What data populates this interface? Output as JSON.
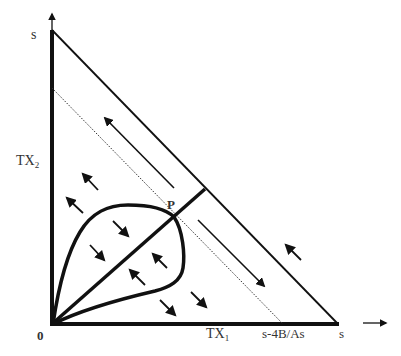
{
  "diagram": {
    "type": "phase-diagram",
    "colors": {
      "ink": "#111111",
      "label": "#333333",
      "background": "#ffffff"
    },
    "axes": {
      "x_label": "TX",
      "x_label_sub": "1",
      "y_label": "TX",
      "y_label_sub": "2",
      "origin_label": "0",
      "x_max_label": "s",
      "y_max_label": "s",
      "x_intercept_label": "s-4B/As"
    },
    "point_label": "P",
    "elements": {
      "boundary_line": "hypotenuse from (0,s) to (s,0)",
      "dotted_line": "parallel line ending at s-4B/As on TX1 axis",
      "diagonal": "thick line from origin through P to boundary",
      "loop": "closed curve through origin and P",
      "long_arrows": [
        "up-left along boundary (above P)",
        "down-right along boundary (below P)"
      ],
      "small_arrows": [
        {
          "direction": "up-left"
        },
        {
          "direction": "up-left"
        },
        {
          "direction": "down-right"
        },
        {
          "direction": "down-right"
        },
        {
          "direction": "up-left"
        },
        {
          "direction": "up-left"
        },
        {
          "direction": "down-right"
        },
        {
          "direction": "down-right"
        },
        {
          "direction": "up-left"
        }
      ],
      "external_arrow": "right-pointing arrow beyond TX1 axis"
    }
  }
}
